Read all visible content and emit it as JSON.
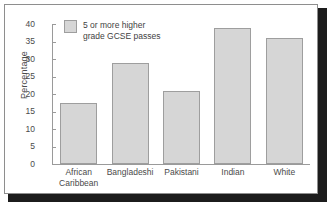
{
  "chart_data": {
    "type": "bar",
    "title": "",
    "xlabel": "",
    "ylabel": "Percentage",
    "ylim": [
      0,
      40
    ],
    "ytick_step": 5,
    "grid": false,
    "legend_position": "top-left",
    "categories": [
      "African Caribbean",
      "Bangladeshi",
      "Pakistani",
      "Indian",
      "White"
    ],
    "category_lines": [
      [
        "African",
        "Caribbean"
      ],
      [
        "Bangladeshi"
      ],
      [
        "Pakistani"
      ],
      [
        "Indian"
      ],
      [
        "White"
      ]
    ],
    "values": [
      17.5,
      29,
      21,
      39,
      36
    ],
    "ytick_labels": [
      "40",
      "35",
      "30",
      "25",
      "20",
      "15",
      "10",
      "5",
      "0"
    ],
    "ytick_values": [
      40,
      35,
      30,
      25,
      20,
      15,
      10,
      5,
      0
    ],
    "series": [
      {
        "name": "5 or more higher grade GCSE passes",
        "values": [
          17.5,
          29,
          21,
          39,
          36
        ],
        "color": "#d6d6d6",
        "edge_color": "#9e9e9e"
      }
    ]
  },
  "legend": {
    "entry_label": "5 or more higher\ngrade GCSE passes",
    "swatch_color": "#d6d6d6"
  },
  "axes": {
    "y_axis_title": "Percentage"
  },
  "colors": {
    "bar_fill": "#d6d6d6",
    "bar_edge": "#9e9e9e",
    "axis": "#9a9a9a",
    "text": "#4a4a4a",
    "frame": "#8e8e8e",
    "shadow": "#1c1c1c",
    "background": "#ffffff"
  }
}
